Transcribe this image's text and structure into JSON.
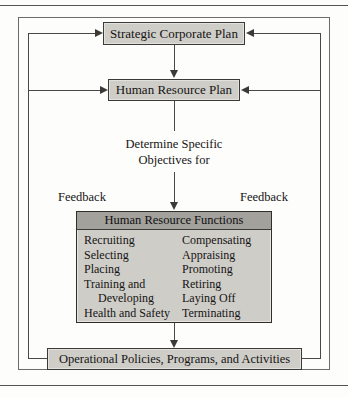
{
  "diagram": {
    "nodes": {
      "strategic_plan": "Strategic Corporate Plan",
      "hr_plan": "Human Resource Plan",
      "determine_line1": "Determine Specific",
      "determine_line2": "Objectives for",
      "operational": "Operational Policies, Programs, and Activities"
    },
    "feedback": {
      "left_label": "Feedback",
      "right_label": "Feedback"
    },
    "functions_panel": {
      "header": "Human Resource Functions",
      "left_column": [
        "Recruiting",
        "Selecting",
        "Placing",
        "Training and",
        "Developing",
        "Health and Safety"
      ],
      "right_column": [
        "Compensating",
        "Appraising",
        "Promoting",
        "Retiring",
        "Laying Off",
        "Terminating"
      ]
    },
    "colors": {
      "box_fill": "#cfcdc8",
      "header_fill": "#a3a19c",
      "line": "#4a4846",
      "text": "#151413"
    }
  }
}
